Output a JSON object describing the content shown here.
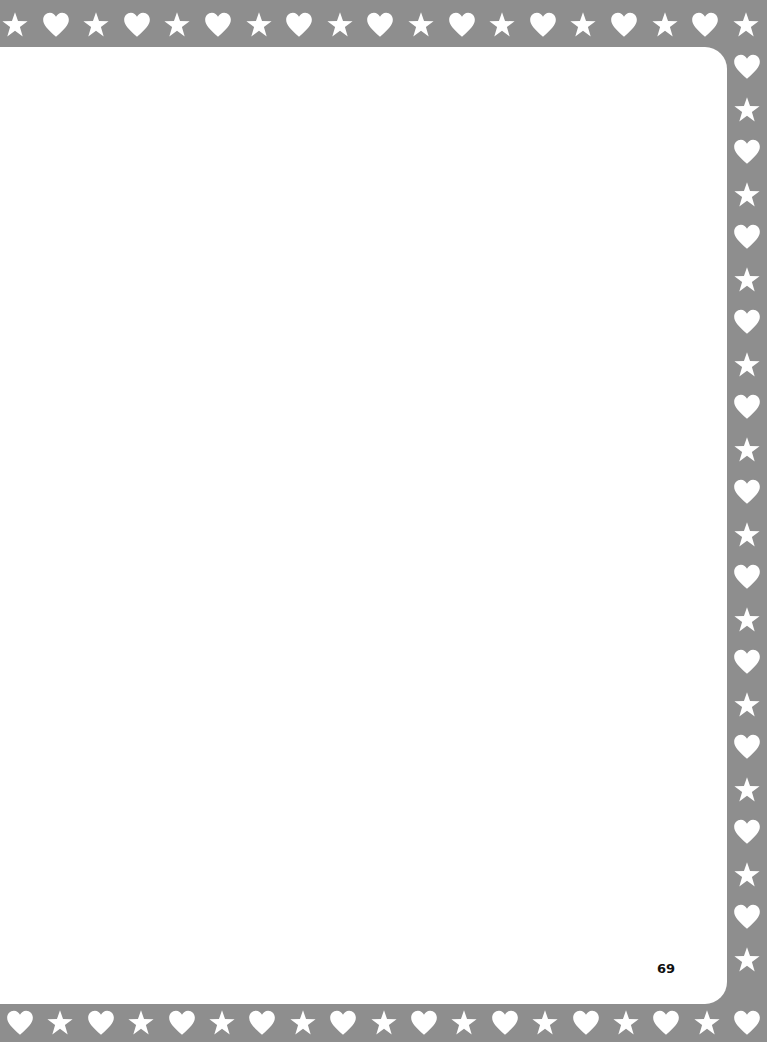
{
  "page": {
    "number": "69",
    "background": "#ffffff",
    "border_color": "#8e8e8e",
    "border_pattern": [
      "star-icon",
      "heart-icon"
    ]
  }
}
